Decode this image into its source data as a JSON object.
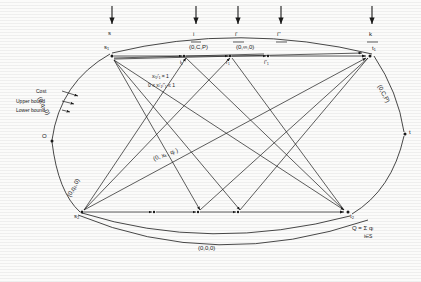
{
  "figure": {
    "type": "network-flow-diagram",
    "ink_color": "#1a1a1a",
    "background": "#fbfbfa"
  },
  "nodes": {
    "origin": "O",
    "sink": "t",
    "source1": "s",
    "source1_node": "s₁",
    "source2_node": "s₂",
    "terminal1_node": "t₁",
    "terminal2_node": "t₂",
    "inter_1": "i₁",
    "inter_1p": "i'₁",
    "inter_1pp": "i''₁"
  },
  "top_arrow_labels": {
    "a1": "s",
    "a2": "i",
    "a3": "i'",
    "a4": "i''",
    "a5": "k"
  },
  "arc_labels": {
    "top_left": "(0,C,P)",
    "top_right": "(0,∞,0)",
    "right_edge": "(0,C,P)",
    "left_upper": "(0,q₁,0)",
    "left_lower": "(0,q₂,0)",
    "bottom": "(0,0,0)",
    "middle": "(0, xₖ, qᵢ )"
  },
  "annotations": {
    "cost": "Cost",
    "upper_bound": "Upper bound",
    "lower_bound": "Lower bound",
    "constraint_1": "xᵢ₁ᵢ'₁ = 1",
    "constraint_2": "0 ≤ xᵢ'₁ᵢ''₁ ≤ 1",
    "sum_formula": "Q = Σ  qᵢ",
    "sum_subscript": "i∈S"
  }
}
